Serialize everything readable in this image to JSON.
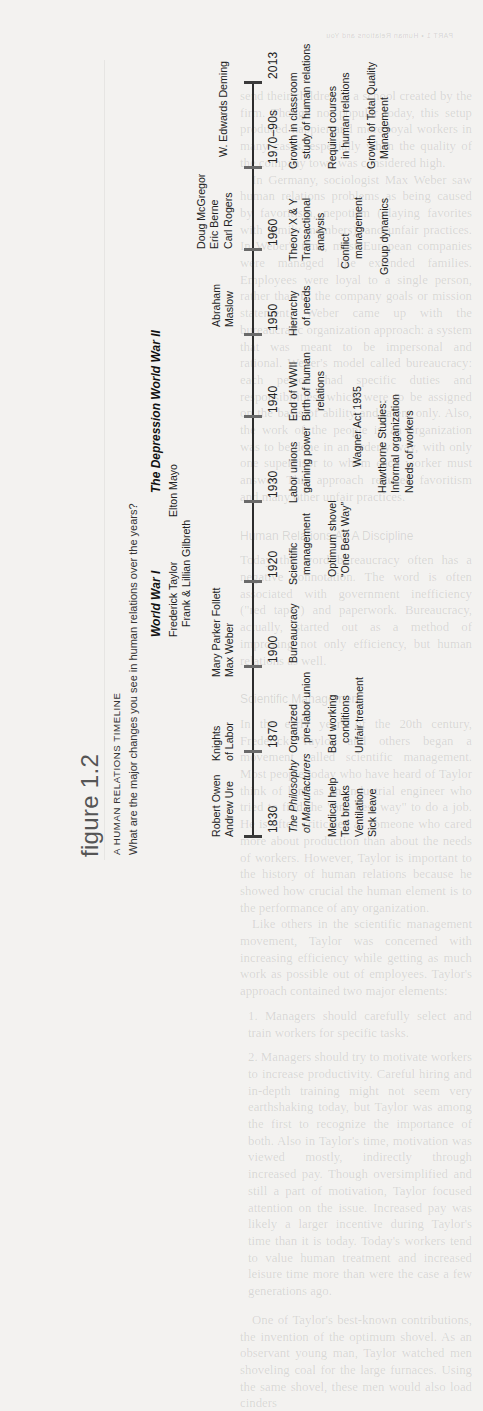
{
  "page_header": "PART 1   •   Human Relations and You",
  "background_text": {
    "paragraphs": [
      "send their children to a school created by the firm. Though not popular today, this setup produced happier and more loyal workers in many cases, especially when the quality of the company town was considered high.",
      "In Germany, sociologist Max Weber saw human relations problems as being caused by favoritism, nepotism (playing favorites with family members), and unfair practices. In Weber's time, most European companies were managed like extended families. Employees were loyal to a single person, rather than to the company goals or mission statement. Weber came up with the bureaucratic organization approach: a system that was meant to be impersonal and rational. Weber's model called bureaucracy: each person had specific duties and responsibilities, which were to be assigned on the basis of ability and talent only. Also, the work of the people in an organization was to be done in an orderly way, with only one supervisor to whom each worker must answer. This approach reduced favoritism and many other unfair practices."
    ],
    "headings": [
      "Human Relations As A Discipline",
      "Scientific Management"
    ],
    "paragraphs_2": [
      "Today the word bureaucracy often has a negative connotation. The word is often associated with government inefficiency (\"red tape\") and paperwork. Bureaucracy, actually, started out as a method of improving not only efficiency, but human relations as well.",
      "In the early years of the 20th century, Frederick Taylor and others began a movement called scientific management. Most people today who have heard of Taylor think of him as an industrial engineer who tried to find the \"one best way\" to do a job. He is often criticized as someone who cared more about production than about the needs of workers. However, Taylor is important to the history of human relations because he showed how crucial the human element is to the performance of any organization.",
      "Like others in the scientific management movement, Taylor was concerned with increasing efficiency while getting as much work as possible out of employees. Taylor's approach contained two major elements:",
      "1. Managers should carefully select and train workers for specific tasks.",
      "2. Managers should try to motivate workers to increase productivity. Careful hiring and in-depth training might not seem very earthshaking today, but Taylor was among the first to recognize the importance of both. Also in Taylor's time, motivation was viewed mostly, indirectly through increased pay. Though oversimplified and still a part of motivation, Taylor focused attention on the issue. Increased pay was likely a larger incentive during Taylor's time than it is today. Today's workers tend to value human treatment and increased leisure time more than were the case a few generations ago.",
      "One of Taylor's best-known contributions, the invention of the optimum shovel. As an observant young man, Taylor watched men shoveling coal for the large furnaces. Using the same shovel, these men would also load cinders"
    ]
  },
  "figure": {
    "number": "figure 1.2",
    "title": "A HUMAN RELATIONS TIMELINE",
    "question": "What are the major changes you see in human relations over the years?",
    "eras": [
      {
        "label": "World War I"
      },
      {
        "label": "The Depression World War II"
      }
    ],
    "people": [
      {
        "lines": [
          "Robert Owen",
          "Andrew Ure"
        ]
      },
      {
        "lines": [
          "Knights",
          "of Labor"
        ]
      },
      {
        "lines": [
          "Mary Parker Follett",
          "Max Weber"
        ]
      },
      {
        "lines": [
          "Frederick Taylor",
          "Frank & Lillian Gilbreth"
        ]
      },
      {
        "lines": [
          "Elton Mayo"
        ]
      },
      {
        "lines": [
          "Abraham",
          "Maslow"
        ]
      },
      {
        "lines": [
          "Doug McGregor",
          "Eric Berne",
          "Carl Rogers"
        ]
      },
      {
        "lines": [
          "W. Edwards Deming"
        ]
      }
    ],
    "years": [
      "1830",
      "1870",
      "1900",
      "1920",
      "1930",
      "1940",
      "1950",
      "1960",
      "1970–90s",
      "2013"
    ],
    "events": {
      "1830": {
        "row1": [
          "The Philosophy",
          "of Manufacturers"
        ],
        "row1_italic": true,
        "row2": [
          "Medical help",
          "Tea breaks",
          "Ventilation",
          "Sick leave"
        ]
      },
      "1870": {
        "row1": [
          "Organized",
          "pre-labor union"
        ],
        "row2": [
          "Bad working",
          "conditions",
          "Unfair treatment"
        ]
      },
      "1900": {
        "row1": [
          "Bureaucracy"
        ]
      },
      "1920": {
        "row1": [
          "Scientific",
          "management"
        ],
        "row2": [
          "Optimum shovel",
          "“One Best Way”"
        ]
      },
      "1930": {
        "row1": [
          "Labor unions",
          "gaining power"
        ],
        "row2": [
          "Wagner Act 1935"
        ],
        "row3": [
          "Hawthorne Studies:",
          "Informal organization",
          "Needs of workers"
        ]
      },
      "1940": {
        "row1": [
          "End of WWII",
          "Birth of human",
          "relations"
        ]
      },
      "1950": {
        "row1": [
          "Hierarchy",
          "of needs"
        ]
      },
      "1960": {
        "row1": [
          "Theory X & Y",
          "Transactional",
          "analysis"
        ],
        "row2": [
          "Conflict",
          "management"
        ],
        "row3": [
          "Group dynamics"
        ]
      },
      "1970–90s": {
        "row1": [
          "Growth in classroom",
          "study of human relations"
        ],
        "row2": [
          "Required courses",
          "in human relations"
        ],
        "row3": [
          "Growth of Total Quality",
          "Management"
        ]
      }
    }
  }
}
